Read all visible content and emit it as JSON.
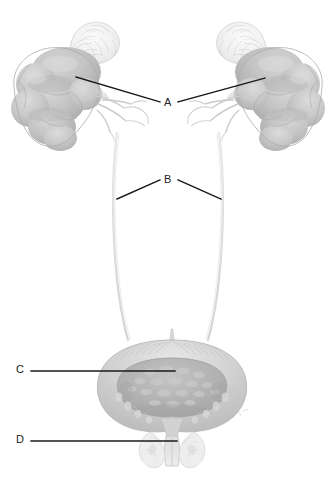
{
  "figure": {
    "background_color": "#ffffff",
    "width": 336,
    "height": 481,
    "style": "grayscale pencil/wash medical illustration",
    "leader_line_color": "#1a1a1a",
    "label_text_color": "#222222"
  },
  "labels": [
    {
      "id": "A",
      "text": "A",
      "x": 168,
      "y": 103,
      "points_to": "kidneys",
      "leader_lines": [
        {
          "x1": 76,
          "y1": 77,
          "x2": 160,
          "y2": 102
        },
        {
          "x1": 178,
          "y1": 102,
          "x2": 265,
          "y2": 78
        }
      ]
    },
    {
      "id": "B",
      "text": "B",
      "x": 168,
      "y": 180,
      "points_to": "ureters",
      "leader_lines": [
        {
          "x1": 117,
          "y1": 199,
          "x2": 160,
          "y2": 180
        },
        {
          "x1": 178,
          "y1": 180,
          "x2": 221,
          "y2": 199
        }
      ]
    },
    {
      "id": "C",
      "text": "C",
      "x": 20,
      "y": 370,
      "points_to": "urinary bladder interior",
      "leader_lines": [
        {
          "x1": 31,
          "y1": 371,
          "x2": 175,
          "y2": 371
        }
      ]
    },
    {
      "id": "D",
      "text": "D",
      "x": 20,
      "y": 440,
      "points_to": "urethra",
      "leader_lines": [
        {
          "x1": 31,
          "y1": 441,
          "x2": 177,
          "y2": 441
        }
      ]
    }
  ],
  "structures": {
    "left_kidney": {
      "name": "left kidney",
      "center_x": 65,
      "center_y": 95,
      "fill": "#c2c2c2",
      "appearance": "lobulated fetal kidney, multiple rounded lobes"
    },
    "right_kidney": {
      "name": "right kidney",
      "center_x": 271,
      "center_y": 95,
      "fill": "#c2c2c2",
      "appearance": "lobulated fetal kidney, mirrored"
    },
    "left_adrenal_gland": {
      "name": "left adrenal gland",
      "center_x": 90,
      "center_y": 45,
      "fill": "#f2f2f2",
      "appearance": "pale textured cap above kidney"
    },
    "right_adrenal_gland": {
      "name": "right adrenal gland",
      "center_x": 246,
      "center_y": 48,
      "fill": "#f2f2f2",
      "appearance": "pale textured cap above kidney"
    },
    "left_renal_vessels": {
      "name": "left renal vessels",
      "fill": "#d8d8d8"
    },
    "right_renal_vessels": {
      "name": "right renal vessels",
      "fill": "#d8d8d8"
    },
    "left_ureter": {
      "name": "left ureter",
      "stroke": "#dcdcdc",
      "from_y": 120,
      "to_y": 345
    },
    "right_ureter": {
      "name": "right ureter",
      "stroke": "#dcdcdc",
      "from_y": 120,
      "to_y": 345
    },
    "bladder": {
      "name": "urinary bladder",
      "center_x": 172,
      "center_y": 385,
      "outer_fill": "#d5d5d5",
      "interior_fill": "#b5b5b5",
      "appearance": "sectioned bladder showing trigone and muscular wall"
    },
    "urethra": {
      "name": "urethra",
      "center_x": 172,
      "center_y": 450,
      "fill": "#e2e2e2"
    }
  }
}
